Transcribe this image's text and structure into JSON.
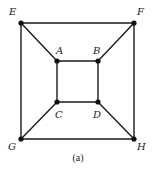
{
  "diagram": {
    "type": "graph",
    "caption": "(a)",
    "vertices": [
      {
        "id": "E",
        "label": "E",
        "x": 21,
        "y": 23,
        "lx": 9,
        "ly": 15
      },
      {
        "id": "F",
        "label": "F",
        "x": 134,
        "y": 23,
        "lx": 137,
        "ly": 15
      },
      {
        "id": "A",
        "label": "A",
        "x": 57,
        "y": 61,
        "lx": 56,
        "ly": 54
      },
      {
        "id": "B",
        "label": "B",
        "x": 98,
        "y": 61,
        "lx": 93,
        "ly": 54
      },
      {
        "id": "C",
        "label": "C",
        "x": 57,
        "y": 102,
        "lx": 55,
        "ly": 118
      },
      {
        "id": "D",
        "label": "D",
        "x": 98,
        "y": 102,
        "lx": 93,
        "ly": 118
      },
      {
        "id": "G",
        "label": "G",
        "x": 21,
        "y": 139,
        "lx": 8,
        "ly": 150
      },
      {
        "id": "H",
        "label": "H",
        "x": 134,
        "y": 139,
        "lx": 137,
        "ly": 150
      }
    ],
    "edges": [
      [
        "E",
        "F"
      ],
      [
        "F",
        "H"
      ],
      [
        "H",
        "G"
      ],
      [
        "G",
        "E"
      ],
      [
        "A",
        "B"
      ],
      [
        "B",
        "D"
      ],
      [
        "D",
        "C"
      ],
      [
        "C",
        "A"
      ],
      [
        "E",
        "A"
      ],
      [
        "F",
        "B"
      ],
      [
        "G",
        "C"
      ],
      [
        "H",
        "D"
      ]
    ]
  }
}
